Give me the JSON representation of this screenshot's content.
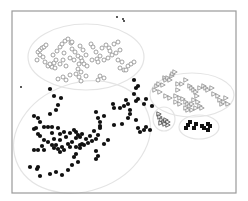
{
  "chart_data": {
    "type": "scatter",
    "title": "",
    "xlabel": "",
    "ylabel": "",
    "grid": false,
    "legend": null,
    "frame": {
      "x": 12,
      "y": 11,
      "w": 224,
      "h": 182,
      "color": "#9a9a9a"
    },
    "colors": {
      "ellipse": "#e4e4e4",
      "circle_stroke": "#8a8a8a",
      "triangle_stroke": "#8a8a8a",
      "filled": "#111111"
    },
    "clusters": [
      {
        "name": "open-circles",
        "marker": "circle-open",
        "ellipse": {
          "cx": 86,
          "cy": 57,
          "rx": 58,
          "ry": 33,
          "rot": 0
        },
        "points": [
          [
            38,
            52
          ],
          [
            40,
            50
          ],
          [
            42,
            48
          ],
          [
            44,
            47
          ],
          [
            46,
            45
          ],
          [
            40,
            55
          ],
          [
            43,
            57
          ],
          [
            37,
            60
          ],
          [
            45,
            62
          ],
          [
            48,
            66
          ],
          [
            52,
            67
          ],
          [
            50,
            64
          ],
          [
            55,
            68
          ],
          [
            54,
            63
          ],
          [
            56,
            60
          ],
          [
            53,
            55
          ],
          [
            57,
            51
          ],
          [
            60,
            47
          ],
          [
            62,
            44
          ],
          [
            65,
            41
          ],
          [
            68,
            39
          ],
          [
            71,
            43
          ],
          [
            72,
            49
          ],
          [
            75,
            52
          ],
          [
            78,
            56
          ],
          [
            74,
            60
          ],
          [
            70,
            58
          ],
          [
            64,
            53
          ],
          [
            63,
            60
          ],
          [
            60,
            64
          ],
          [
            66,
            66
          ],
          [
            72,
            42
          ],
          [
            80,
            46
          ],
          [
            83,
            50
          ],
          [
            86,
            55
          ],
          [
            81,
            58
          ],
          [
            82,
            61
          ],
          [
            84,
            64
          ],
          [
            87,
            66
          ],
          [
            79,
            64
          ],
          [
            78,
            69
          ],
          [
            81,
            72
          ],
          [
            76,
            74
          ],
          [
            70,
            75
          ],
          [
            63,
            77
          ],
          [
            58,
            79
          ],
          [
            66,
            80
          ],
          [
            79,
            77
          ],
          [
            81,
            81
          ],
          [
            86,
            76
          ],
          [
            91,
            44
          ],
          [
            93,
            47
          ],
          [
            96,
            52
          ],
          [
            100,
            56
          ],
          [
            97,
            59
          ],
          [
            92,
            60
          ],
          [
            98,
            62
          ],
          [
            102,
            48
          ],
          [
            106,
            45
          ],
          [
            109,
            48
          ],
          [
            110,
            51
          ],
          [
            112,
            55
          ],
          [
            108,
            58
          ],
          [
            104,
            60
          ],
          [
            114,
            44
          ],
          [
            118,
            42
          ],
          [
            120,
            50
          ],
          [
            116,
            53
          ],
          [
            118,
            60
          ],
          [
            122,
            62
          ],
          [
            120,
            68
          ],
          [
            124,
            70
          ],
          [
            128,
            66
          ],
          [
            131,
            64
          ],
          [
            134,
            62
          ],
          [
            126,
            70
          ],
          [
            100,
            76
          ],
          [
            98,
            80
          ],
          [
            104,
            78
          ]
        ]
      },
      {
        "name": "filled-dots",
        "marker": "circle-filled",
        "ellipse": {
          "cx": 82,
          "cy": 137,
          "rx": 70,
          "ry": 54,
          "rot": -20
        },
        "points": [
          [
            50,
            89
          ],
          [
            54,
            96
          ],
          [
            61,
            98
          ],
          [
            58,
            105
          ],
          [
            56,
            110
          ],
          [
            34,
            116
          ],
          [
            38,
            118
          ],
          [
            40,
            122
          ],
          [
            50,
            114
          ],
          [
            36,
            128
          ],
          [
            38,
            134
          ],
          [
            44,
            127
          ],
          [
            48,
            127
          ],
          [
            34,
            129
          ],
          [
            40,
            136
          ],
          [
            52,
            127
          ],
          [
            52,
            133
          ],
          [
            54,
            139
          ],
          [
            58,
            128
          ],
          [
            60,
            134
          ],
          [
            64,
            132
          ],
          [
            66,
            137
          ],
          [
            60,
            140
          ],
          [
            70,
            133
          ],
          [
            74,
            130
          ],
          [
            76,
            132
          ],
          [
            78,
            135
          ],
          [
            80,
            137
          ],
          [
            82,
            134
          ],
          [
            76,
            138
          ],
          [
            72,
            142
          ],
          [
            68,
            144
          ],
          [
            62,
            147
          ],
          [
            58,
            149
          ],
          [
            56,
            145
          ],
          [
            52,
            145
          ],
          [
            48,
            142
          ],
          [
            44,
            140
          ],
          [
            42,
            146
          ],
          [
            38,
            150
          ],
          [
            34,
            150
          ],
          [
            44,
            150
          ],
          [
            54,
            148
          ],
          [
            60,
            152
          ],
          [
            64,
            150
          ],
          [
            70,
            147
          ],
          [
            76,
            147
          ],
          [
            80,
            145
          ],
          [
            84,
            145
          ],
          [
            88,
            143
          ],
          [
            92,
            141
          ],
          [
            96,
            139
          ],
          [
            98,
            135
          ],
          [
            100,
            128
          ],
          [
            100,
            122
          ],
          [
            98,
            118
          ],
          [
            96,
            112
          ],
          [
            104,
            116
          ],
          [
            100,
            126
          ],
          [
            94,
            131
          ],
          [
            90,
            136
          ],
          [
            86,
            139
          ],
          [
            82,
            144
          ],
          [
            80,
            148
          ],
          [
            76,
            154
          ],
          [
            74,
            157
          ],
          [
            78,
            162
          ],
          [
            72,
            165
          ],
          [
            68,
            170
          ],
          [
            62,
            175
          ],
          [
            56,
            172
          ],
          [
            50,
            174
          ],
          [
            40,
            176
          ],
          [
            37,
            169
          ],
          [
            38,
            167
          ],
          [
            30,
            167
          ],
          [
            96,
            151
          ],
          [
            98,
            156
          ],
          [
            96,
            159
          ],
          [
            104,
            144
          ],
          [
            108,
            140
          ],
          [
            113,
            104
          ],
          [
            114,
            108
          ],
          [
            120,
            108
          ],
          [
            124,
            106
          ],
          [
            126,
            100
          ],
          [
            128,
            104
          ],
          [
            130,
            110
          ],
          [
            134,
            94
          ],
          [
            136,
            88
          ],
          [
            138,
            99
          ],
          [
            136,
            101
          ],
          [
            138,
            86
          ],
          [
            134,
            80
          ],
          [
            130,
            114
          ],
          [
            128,
            118
          ],
          [
            122,
            124
          ],
          [
            114,
            125
          ],
          [
            136,
            120
          ],
          [
            138,
            128
          ],
          [
            140,
            132
          ],
          [
            144,
            130
          ],
          [
            146,
            127
          ],
          [
            150,
            130
          ],
          [
            144,
            104
          ],
          [
            146,
            99
          ],
          [
            152,
            106
          ]
        ]
      },
      {
        "name": "open-triangles",
        "marker": "triangle-open",
        "ellipse": {
          "cx": 192,
          "cy": 95,
          "rx": 42,
          "ry": 22,
          "rot": 0
        },
        "points": [
          [
            155,
            90
          ],
          [
            157,
            86
          ],
          [
            159,
            84
          ],
          [
            163,
            85
          ],
          [
            160,
            92
          ],
          [
            165,
            78
          ],
          [
            166,
            80
          ],
          [
            168,
            78
          ],
          [
            172,
            76
          ],
          [
            170,
            80
          ],
          [
            173,
            74
          ],
          [
            175,
            72
          ],
          [
            178,
            84
          ],
          [
            178,
            90
          ],
          [
            182,
            84
          ],
          [
            186,
            80
          ],
          [
            190,
            86
          ],
          [
            192,
            88
          ],
          [
            194,
            90
          ],
          [
            196,
            92
          ],
          [
            197,
            96
          ],
          [
            200,
            88
          ],
          [
            204,
            86
          ],
          [
            206,
            88
          ],
          [
            208,
            90
          ],
          [
            212,
            88
          ],
          [
            214,
            94
          ],
          [
            218,
            96
          ],
          [
            220,
            100
          ],
          [
            222,
            104
          ],
          [
            224,
            102
          ],
          [
            226,
            98
          ],
          [
            228,
            104
          ],
          [
            176,
            96
          ],
          [
            180,
            98
          ],
          [
            183,
            99
          ],
          [
            186,
            102
          ],
          [
            188,
            104
          ],
          [
            190,
            106
          ],
          [
            192,
            104
          ],
          [
            194,
            100
          ],
          [
            198,
            102
          ],
          [
            200,
            106
          ],
          [
            202,
            108
          ],
          [
            196,
            108
          ],
          [
            192,
            110
          ],
          [
            188,
            110
          ],
          [
            186,
            108
          ],
          [
            180,
            104
          ],
          [
            176,
            102
          ],
          [
            170,
            98
          ],
          [
            166,
            96
          ]
        ]
      },
      {
        "name": "small-triangles",
        "marker": "triangle-open-dark",
        "ellipse": {
          "cx": 164,
          "cy": 119,
          "rx": 11,
          "ry": 12,
          "rot": 0
        },
        "points": [
          [
            159,
            114
          ],
          [
            160,
            117
          ],
          [
            162,
            120
          ],
          [
            161,
            123
          ],
          [
            164,
            122
          ],
          [
            166,
            120
          ],
          [
            168,
            122
          ],
          [
            168,
            125
          ],
          [
            165,
            124
          ]
        ]
      },
      {
        "name": "filled-squares",
        "marker": "square-filled",
        "ellipse": {
          "cx": 199,
          "cy": 127,
          "rx": 20,
          "ry": 12,
          "rot": 0
        },
        "points": [
          [
            186,
            128
          ],
          [
            188,
            125
          ],
          [
            190,
            122
          ],
          [
            194,
            128
          ],
          [
            196,
            124
          ],
          [
            202,
            126
          ],
          [
            204,
            128
          ],
          [
            208,
            124
          ],
          [
            210,
            126
          ],
          [
            208,
            130
          ]
        ]
      }
    ],
    "outliers": [
      [
        117,
        17
      ],
      [
        123,
        19
      ],
      [
        124,
        21
      ],
      [
        21,
        87
      ]
    ]
  }
}
